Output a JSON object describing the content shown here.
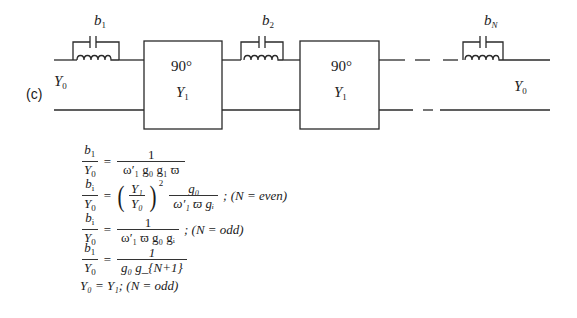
{
  "figure": {
    "panel_label": "(c)",
    "source_admittance": {
      "symbol": "Y",
      "subscript": "0"
    },
    "load_admittance": {
      "symbol": "Y",
      "subscript": "0"
    },
    "resonators": [
      {
        "symbol": "b",
        "subscript": "1"
      },
      {
        "symbol": "b",
        "subscript": "2"
      },
      {
        "symbol": "b",
        "subscript": "N"
      }
    ],
    "inverters": [
      {
        "phase": "90°",
        "admittance_symbol": "Y",
        "admittance_subscript": "1"
      },
      {
        "phase": "90°",
        "admittance_symbol": "Y",
        "admittance_subscript": "1"
      }
    ]
  },
  "equations": [
    {
      "lhs_num": {
        "sym": "b",
        "sub": "1"
      },
      "lhs_den": {
        "sym": "Y",
        "sub": "0"
      },
      "rhs_num": "1",
      "rhs_den": "ω′₁ g₀ g₁ ϖ",
      "rhs_den_parts": {
        "omega": "ω",
        "omega_sub": "1",
        "g0": "g",
        "g0_sub": "0",
        "g1": "g",
        "g1_sub": "1",
        "varpi": "ϖ"
      },
      "condition": ""
    },
    {
      "lhs_num": {
        "sym": "b",
        "sub": "i"
      },
      "lhs_den": {
        "sym": "Y",
        "sub": "0"
      },
      "factor": {
        "num": "Y₁",
        "den": "Y₀",
        "power": "2"
      },
      "rhs_num": "g₀",
      "rhs_den": "ω′₁ ϖ gᵢ",
      "condition": "; (N = even)",
      "condition_parts": {
        "prefix": "; (",
        "var": "N",
        "eq": " = ",
        "value": "even",
        "suffix": " )"
      }
    },
    {
      "lhs_num": {
        "sym": "b",
        "sub": "i"
      },
      "lhs_den": {
        "sym": "Y",
        "sub": "0"
      },
      "rhs_num": "1",
      "rhs_den": "ω′₁ ϖ g₀ gᵢ",
      "condition": "; (N = odd)",
      "condition_parts": {
        "prefix": "; (",
        "var": "N",
        "eq": " = ",
        "value": "odd",
        "suffix": " )"
      }
    },
    {
      "lhs_num": {
        "sym": "b",
        "sub": "1"
      },
      "lhs_den": {
        "sym": "Y",
        "sub": "0"
      },
      "rhs_num": "1",
      "rhs_den": "g₀ g_{N+1}",
      "condition": ""
    },
    {
      "text": "Y₀ = Y₁; (N = odd)",
      "parts": {
        "lhs_sym": "Y",
        "lhs_sub": "0",
        "rhs_sym": "Y",
        "rhs_sub": "1",
        "prefix": "; (",
        "var": "N",
        "eq": " = ",
        "value": "odd",
        "suffix": " )"
      }
    }
  ],
  "colors": {
    "line": "#2a2a2a",
    "background": "#ffffff"
  }
}
